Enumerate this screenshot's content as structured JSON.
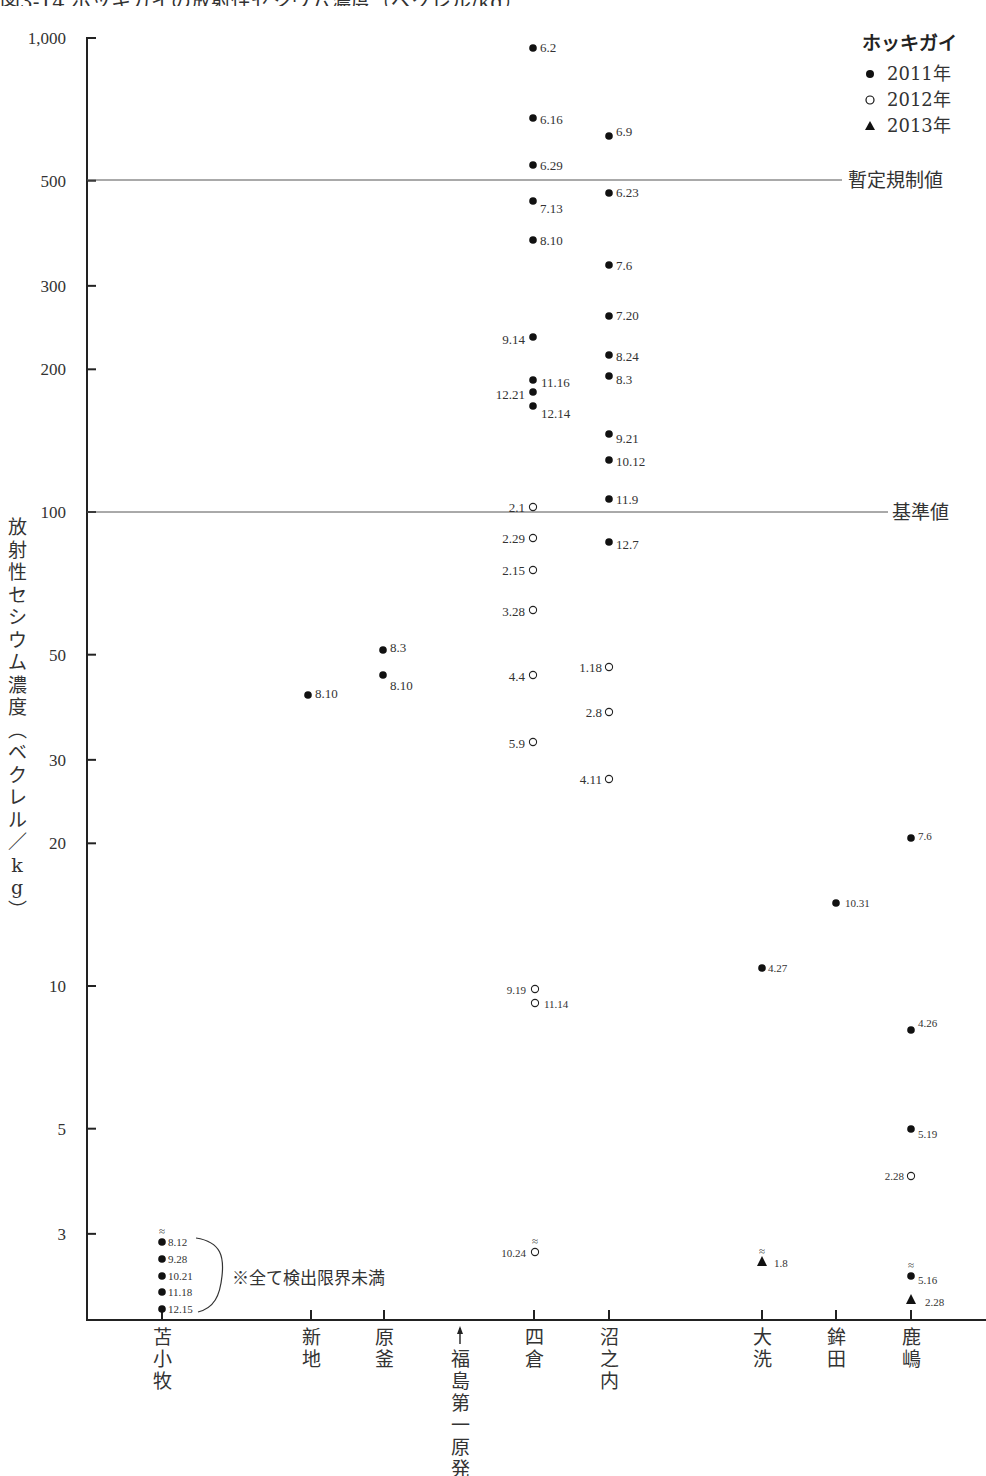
{
  "title": "図3-14 ホッキガイの放射性セシウム濃度（ベクレル/kg）",
  "chart_data": {
    "type": "scatter",
    "title": "ホッキガイの放射性セシウム濃度",
    "ylabel": "放射性セシウム濃度（ベクレル/kg）",
    "xlabel": "",
    "yscale": "log",
    "ylim": [
      2,
      1000
    ],
    "yticks": [
      {
        "value": 1000,
        "label": "1,000"
      },
      {
        "value": 500,
        "label": "500"
      },
      {
        "value": 300,
        "label": "300"
      },
      {
        "value": 200,
        "label": "200"
      },
      {
        "value": 100,
        "label": "100"
      },
      {
        "value": 50,
        "label": "50"
      },
      {
        "value": 30,
        "label": "30"
      },
      {
        "value": 20,
        "label": "20"
      },
      {
        "value": 10,
        "label": "10"
      },
      {
        "value": 5,
        "label": "5"
      },
      {
        "value": 3,
        "label": "3"
      }
    ],
    "categories": [
      "苫小牧",
      "新地",
      "原釜",
      "四倉",
      "沼之内",
      "大洗",
      "鉾田",
      "鹿嶋"
    ],
    "category_x": {
      "苫小牧": 162,
      "新地": 311,
      "原釜": 384,
      "四倉": 534,
      "沼之内": 609,
      "大洗": 762,
      "鉾田": 836,
      "鹿嶋": 911
    },
    "marker_label": {
      "text": "福島第一原発",
      "x": 460,
      "arrow": true
    },
    "legend": {
      "title": "ホッキガイ",
      "position": "top-right",
      "entries": [
        {
          "marker": "filled-circle",
          "label": "2011年"
        },
        {
          "marker": "open-circle",
          "label": "2012年"
        },
        {
          "marker": "filled-triangle",
          "label": "2013年"
        }
      ]
    },
    "reference_lines": [
      {
        "value": 500,
        "label": "暫定規制値"
      },
      {
        "value": 100,
        "label": "基準値"
      }
    ],
    "grid": false,
    "note": "※全て検出限界未満",
    "series": [
      {
        "name": "2011年",
        "marker": "filled-circle",
        "points": [
          {
            "site": "苫小牧",
            "date": "8.12",
            "value": null,
            "below_detection": true
          },
          {
            "site": "苫小牧",
            "date": "9.28",
            "value": null,
            "below_detection": true
          },
          {
            "site": "苫小牧",
            "date": "10.21",
            "value": null,
            "below_detection": true
          },
          {
            "site": "苫小牧",
            "date": "11.18",
            "value": null,
            "below_detection": true
          },
          {
            "site": "苫小牧",
            "date": "12.15",
            "value": null,
            "below_detection": true
          },
          {
            "site": "新地",
            "date": "8.10",
            "value": 41
          },
          {
            "site": "原釜",
            "date": "8.3",
            "value": 51
          },
          {
            "site": "原釜",
            "date": "8.10",
            "value": 45
          },
          {
            "site": "四倉",
            "date": "6.2",
            "value": 950
          },
          {
            "site": "四倉",
            "date": "6.16",
            "value": 680
          },
          {
            "site": "四倉",
            "date": "6.29",
            "value": 540
          },
          {
            "site": "四倉",
            "date": "7.13",
            "value": 450
          },
          {
            "site": "四倉",
            "date": "8.10",
            "value": 375
          },
          {
            "site": "四倉",
            "date": "9.14",
            "value": 235
          },
          {
            "site": "四倉",
            "date": "11.16",
            "value": 190
          },
          {
            "site": "四倉",
            "date": "12.21",
            "value": 180
          },
          {
            "site": "四倉",
            "date": "12.14",
            "value": 170
          },
          {
            "site": "沼之内",
            "date": "6.9",
            "value": 620
          },
          {
            "site": "沼之内",
            "date": "6.23",
            "value": 470
          },
          {
            "site": "沼之内",
            "date": "7.6",
            "value": 330
          },
          {
            "site": "沼之内",
            "date": "7.20",
            "value": 260
          },
          {
            "site": "沼之内",
            "date": "8.24",
            "value": 215
          },
          {
            "site": "沼之内",
            "date": "8.3",
            "value": 195
          },
          {
            "site": "沼之内",
            "date": "9.21",
            "value": 145
          },
          {
            "site": "沼之内",
            "date": "10.12",
            "value": 130
          },
          {
            "site": "沼之内",
            "date": "11.9",
            "value": 107
          },
          {
            "site": "沼之内",
            "date": "12.7",
            "value": 86
          },
          {
            "site": "大洗",
            "date": "4.27",
            "value": 11
          },
          {
            "site": "鉾田",
            "date": "10.31",
            "value": 15
          },
          {
            "site": "鹿嶋",
            "date": "7.6",
            "value": 20.5
          },
          {
            "site": "鹿嶋",
            "date": "4.26",
            "value": 8.1
          },
          {
            "site": "鹿嶋",
            "date": "5.19",
            "value": 5.0
          },
          {
            "site": "鹿嶋",
            "date": "5.16",
            "value": null,
            "below_detection": true
          }
        ]
      },
      {
        "name": "2012年",
        "marker": "open-circle",
        "points": [
          {
            "site": "四倉",
            "date": "2.1",
            "value": 102
          },
          {
            "site": "四倉",
            "date": "2.29",
            "value": 88
          },
          {
            "site": "四倉",
            "date": "2.15",
            "value": 75
          },
          {
            "site": "四倉",
            "date": "3.28",
            "value": 62
          },
          {
            "site": "四倉",
            "date": "4.4",
            "value": 45
          },
          {
            "site": "四倉",
            "date": "5.9",
            "value": 33
          },
          {
            "site": "四倉",
            "date": "9.19",
            "value": 9.9
          },
          {
            "site": "四倉",
            "date": "11.14",
            "value": 9.3
          },
          {
            "site": "四倉",
            "date": "10.24",
            "value": null,
            "below_detection": true
          },
          {
            "site": "沼之内",
            "date": "1.18",
            "value": 47
          },
          {
            "site": "沼之内",
            "date": "2.8",
            "value": 38
          },
          {
            "site": "沼之内",
            "date": "4.11",
            "value": 27
          },
          {
            "site": "鹿嶋",
            "date": "2.28",
            "value": 3.9
          }
        ]
      },
      {
        "name": "2013年",
        "marker": "filled-triangle",
        "points": [
          {
            "site": "大洗",
            "date": "1.8",
            "value": null,
            "below_detection": true
          },
          {
            "site": "鹿嶋",
            "date": "2.28",
            "value": null,
            "below_detection": true
          }
        ]
      }
    ]
  },
  "render": {
    "axis_color": "#222222",
    "marker_color": "#111111",
    "text_color": "#333333",
    "points": [
      {
        "x": 533,
        "y": 48,
        "m": "f",
        "label": "6.2",
        "lx": 540,
        "ly": 52,
        "anchor": "start"
      },
      {
        "x": 533,
        "y": 118,
        "m": "f",
        "label": "6.16",
        "lx": 540,
        "ly": 124,
        "anchor": "start"
      },
      {
        "x": 533,
        "y": 165,
        "m": "f",
        "label": "6.29",
        "lx": 540,
        "ly": 170,
        "anchor": "start"
      },
      {
        "x": 533,
        "y": 201,
        "m": "f",
        "label": "7.13",
        "lx": 540,
        "ly": 213,
        "anchor": "start"
      },
      {
        "x": 533,
        "y": 240,
        "m": "f",
        "label": "8.10",
        "lx": 540,
        "ly": 245,
        "anchor": "start"
      },
      {
        "x": 533,
        "y": 337,
        "m": "f",
        "label": "9.14",
        "lx": 525,
        "ly": 344,
        "anchor": "end"
      },
      {
        "x": 533,
        "y": 380,
        "m": "f",
        "label": "11.16",
        "lx": 541,
        "ly": 387,
        "anchor": "start"
      },
      {
        "x": 533,
        "y": 392,
        "m": "f",
        "label": "12.21",
        "lx": 525,
        "ly": 399,
        "anchor": "end"
      },
      {
        "x": 533,
        "y": 406,
        "m": "f",
        "label": "12.14",
        "lx": 541,
        "ly": 418,
        "anchor": "start"
      },
      {
        "x": 609,
        "y": 136,
        "m": "f",
        "label": "6.9",
        "lx": 616,
        "ly": 136,
        "anchor": "start"
      },
      {
        "x": 609,
        "y": 193,
        "m": "f",
        "label": "6.23",
        "lx": 616,
        "ly": 197,
        "anchor": "start"
      },
      {
        "x": 609,
        "y": 265,
        "m": "f",
        "label": "7.6",
        "lx": 616,
        "ly": 270,
        "anchor": "start"
      },
      {
        "x": 609,
        "y": 316,
        "m": "f",
        "label": "7.20",
        "lx": 616,
        "ly": 320,
        "anchor": "start"
      },
      {
        "x": 609,
        "y": 355,
        "m": "f",
        "label": "8.24",
        "lx": 616,
        "ly": 361,
        "anchor": "start"
      },
      {
        "x": 609,
        "y": 376,
        "m": "f",
        "label": "8.3",
        "lx": 616,
        "ly": 384,
        "anchor": "start"
      },
      {
        "x": 609,
        "y": 434,
        "m": "f",
        "label": "9.21",
        "lx": 616,
        "ly": 443,
        "anchor": "start"
      },
      {
        "x": 609,
        "y": 460,
        "m": "f",
        "label": "10.12",
        "lx": 616,
        "ly": 466,
        "anchor": "start"
      },
      {
        "x": 609,
        "y": 499,
        "m": "f",
        "label": "11.9",
        "lx": 616,
        "ly": 504,
        "anchor": "start"
      },
      {
        "x": 609,
        "y": 542,
        "m": "f",
        "label": "12.7",
        "lx": 616,
        "ly": 549,
        "anchor": "start"
      },
      {
        "x": 308,
        "y": 695,
        "m": "f",
        "label": "8.10",
        "lx": 315,
        "ly": 698,
        "anchor": "start"
      },
      {
        "x": 383,
        "y": 650,
        "m": "f",
        "label": "8.3",
        "lx": 390,
        "ly": 652,
        "anchor": "start"
      },
      {
        "x": 383,
        "y": 675,
        "m": "f",
        "label": "8.10",
        "lx": 390,
        "ly": 690,
        "anchor": "start"
      },
      {
        "x": 762,
        "y": 968,
        "m": "f",
        "label": "4.27",
        "lx": 768,
        "ly": 972,
        "anchor": "start",
        "small": true
      },
      {
        "x": 836,
        "y": 903,
        "m": "f",
        "label": "10.31",
        "lx": 845,
        "ly": 907,
        "anchor": "start",
        "small": true
      },
      {
        "x": 911,
        "y": 838,
        "m": "f",
        "label": "7.6",
        "lx": 918,
        "ly": 840,
        "anchor": "start",
        "small": true
      },
      {
        "x": 911,
        "y": 1030,
        "m": "f",
        "label": "4.26",
        "lx": 918,
        "ly": 1027,
        "anchor": "start",
        "small": true
      },
      {
        "x": 911,
        "y": 1129,
        "m": "f",
        "label": "5.19",
        "lx": 918,
        "ly": 1138,
        "anchor": "start",
        "small": true
      },
      {
        "x": 911,
        "y": 1276,
        "m": "f",
        "label": "5.16",
        "lx": 918,
        "ly": 1284,
        "anchor": "start",
        "small": true,
        "approx": true
      },
      {
        "x": 911,
        "y": 1300,
        "m": "t",
        "label": "2.28",
        "lx": 925,
        "ly": 1306,
        "anchor": "start",
        "small": true
      },
      {
        "x": 762,
        "y": 1262,
        "m": "t",
        "label": "1.8",
        "lx": 774,
        "ly": 1267,
        "anchor": "start",
        "small": true,
        "approx": true
      },
      {
        "x": 533,
        "y": 507,
        "m": "o",
        "label": "2.1",
        "lx": 525,
        "ly": 512,
        "anchor": "end"
      },
      {
        "x": 533,
        "y": 538,
        "m": "o",
        "label": "2.29",
        "lx": 525,
        "ly": 543,
        "anchor": "end"
      },
      {
        "x": 533,
        "y": 570,
        "m": "o",
        "label": "2.15",
        "lx": 525,
        "ly": 575,
        "anchor": "end"
      },
      {
        "x": 533,
        "y": 610,
        "m": "o",
        "label": "3.28",
        "lx": 525,
        "ly": 616,
        "anchor": "end"
      },
      {
        "x": 533,
        "y": 675,
        "m": "o",
        "label": "4.4",
        "lx": 525,
        "ly": 681,
        "anchor": "end"
      },
      {
        "x": 533,
        "y": 742,
        "m": "o",
        "label": "5.9",
        "lx": 525,
        "ly": 748,
        "anchor": "end"
      },
      {
        "x": 535,
        "y": 989,
        "m": "o",
        "label": "9.19",
        "lx": 526,
        "ly": 994,
        "anchor": "end",
        "small": true
      },
      {
        "x": 535,
        "y": 1003,
        "m": "o",
        "label": "11.14",
        "lx": 544,
        "ly": 1008,
        "anchor": "start",
        "small": true
      },
      {
        "x": 535,
        "y": 1252,
        "m": "o",
        "label": "10.24",
        "lx": 526,
        "ly": 1257,
        "anchor": "end",
        "small": true,
        "approx": true
      },
      {
        "x": 609,
        "y": 667,
        "m": "o",
        "label": "1.18",
        "lx": 602,
        "ly": 672,
        "anchor": "end"
      },
      {
        "x": 609,
        "y": 712,
        "m": "o",
        "label": "2.8",
        "lx": 602,
        "ly": 717,
        "anchor": "end"
      },
      {
        "x": 609,
        "y": 779,
        "m": "o",
        "label": "4.11",
        "lx": 602,
        "ly": 784,
        "anchor": "end"
      },
      {
        "x": 911,
        "y": 1176,
        "m": "o",
        "label": "2.28",
        "lx": 904,
        "ly": 1180,
        "anchor": "end",
        "small": true
      },
      {
        "x": 162,
        "y": 1242,
        "m": "f",
        "label": "8.12",
        "lx": 168,
        "ly": 1246,
        "anchor": "start",
        "small": true,
        "approx": true
      },
      {
        "x": 162,
        "y": 1259,
        "m": "f",
        "label": "9.28",
        "lx": 168,
        "ly": 1263,
        "anchor": "start",
        "small": true
      },
      {
        "x": 162,
        "y": 1276,
        "m": "f",
        "label": "10.21",
        "lx": 168,
        "ly": 1280,
        "anchor": "start",
        "small": true
      },
      {
        "x": 162,
        "y": 1292,
        "m": "f",
        "label": "11.18",
        "lx": 168,
        "ly": 1296,
        "anchor": "start",
        "small": true
      },
      {
        "x": 162,
        "y": 1309,
        "m": "f",
        "label": "12.15",
        "lx": 168,
        "ly": 1313,
        "anchor": "start",
        "small": true
      }
    ]
  }
}
